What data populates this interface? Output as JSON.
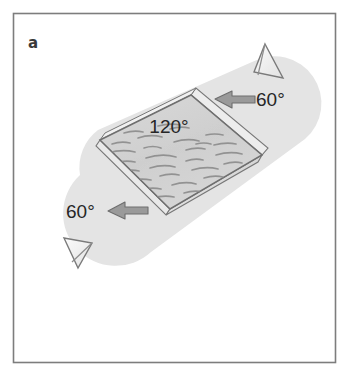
{
  "figure": {
    "panel_label": "a",
    "frame_color": "#7d7d7d",
    "background_color": "#ffffff",
    "band_fill": "#e4e4e4",
    "plate_fill": "#d2d2d2",
    "plate_stroke": "#6f6f6f",
    "texture_color": "#8f8f8f",
    "arrow_fill": "#9a9a9a",
    "arrow_stroke": "#6e6e6e",
    "flag_fill": "#f2f2f2",
    "flag_stroke": "#7a7a7a",
    "text_color": "#262626"
  },
  "labels": {
    "center_angle": "120°",
    "top_right_angle": "60°",
    "bottom_left_angle": "60°"
  },
  "annotations": {
    "top_right_arrow_direction": "left",
    "bottom_left_arrow_direction": "right",
    "top_right_flag": "triangular-flag-up",
    "bottom_left_flag": "triangular-flag-down"
  }
}
